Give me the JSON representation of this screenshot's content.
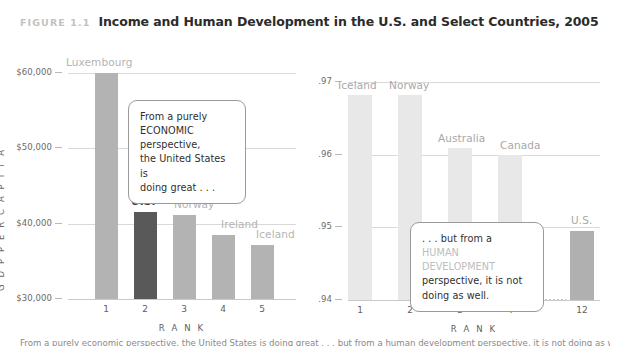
{
  "header": {
    "figure_label": "FIGURE 1.1",
    "title": "Income and Human Development in the U.S. and Select Countries, 2005"
  },
  "colors": {
    "bar_default": "#b3b3b3",
    "bar_highlight": "#595959",
    "bar_default_light": "#e8e8e8",
    "bar_highlight_light": "#b0b0b0",
    "gridline": "#d9d9d9",
    "label_muted": "#b4b4b4",
    "label_emph": "#3d3d3d",
    "figure_label": "#c2c2c2",
    "title": "#2b2b2b",
    "callout_border": "#9a9a9a",
    "ghost_text": "#bdbdbd"
  },
  "callouts": {
    "left": {
      "line1": "From a purely",
      "line2": "ECONOMIC perspective,",
      "line3": "the United States is",
      "line4": "doing great . . ."
    },
    "right": {
      "line1": ". . . but from a",
      "line2_ghost": "HUMAN DEVELOPMENT",
      "line3": "perspective, it is not",
      "line4": "doing as well."
    }
  },
  "caption": {
    "text": "From a purely economic perspective, the United States is doing great . . . but from a human development perspective, it is not doing as well."
  },
  "chart_data": [
    {
      "id": "gdp",
      "type": "bar",
      "title": "",
      "xlabel": "R A N K",
      "ylabel": "G D P   P E R   C A P I T A",
      "ylim": [
        30000,
        62500
      ],
      "yticks": [
        30000,
        40000,
        50000,
        60000
      ],
      "ytick_labels": [
        "$30,000",
        "$40,000",
        "$50,000",
        "$60,000"
      ],
      "grid": true,
      "categories": [
        "1",
        "2",
        "3",
        "4",
        "5"
      ],
      "point_labels": [
        "Luxembourg",
        "U.S.",
        "Norway",
        "Ireland",
        "Iceland"
      ],
      "values": [
        60000,
        41600,
        41100,
        38500,
        37200
      ],
      "highlight_index": 1
    },
    {
      "id": "hdi",
      "type": "bar",
      "title": "",
      "xlabel": "R A N K",
      "ylabel": "",
      "ylim": [
        0.94,
        0.9735
      ],
      "yticks": [
        0.94,
        0.95,
        0.96,
        0.97
      ],
      "ytick_labels": [
        ".94",
        ".95",
        ".96",
        ".97"
      ],
      "grid": true,
      "categories": [
        "1",
        "2",
        "3",
        "4",
        "12"
      ],
      "point_labels": [
        "Iceland",
        "Norway",
        "Australia",
        "Canada",
        "U.S."
      ],
      "values": [
        0.9683,
        0.9683,
        0.961,
        0.96,
        0.9495
      ],
      "highlight_index": 4,
      "axis_break_between": [
        3,
        4
      ]
    }
  ]
}
